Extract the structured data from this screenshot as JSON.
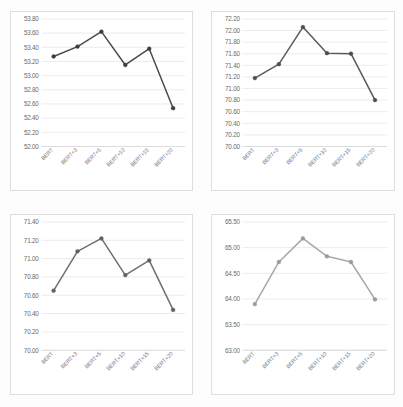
{
  "figure": {
    "background_color": "#fdfdfd",
    "panel_border_color": "#dedede",
    "gridline_color": "#e3e3e3",
    "tick_label_color": "#6b6b6b"
  },
  "chart_data": [
    {
      "id": "chart-top-left",
      "type": "line",
      "title": "",
      "xlabel": "",
      "ylabel": "",
      "categories": [
        "BERT",
        "BERT+3",
        "BERT+5",
        "BERT+10",
        "BERT+15",
        "BERT+20"
      ],
      "values": [
        53.27,
        53.41,
        53.62,
        53.15,
        53.38,
        52.54
      ],
      "ylim": [
        52.0,
        53.8
      ],
      "ytick_step": 0.2,
      "ytick_labels": [
        "52.00",
        "52.20",
        "52.40",
        "52.60",
        "52.80",
        "53.00",
        "53.20",
        "53.40",
        "53.60",
        "53.80"
      ],
      "grid": true,
      "legend": "none",
      "line_color": "#4a4a4a",
      "marker_color": "#3d3d3d",
      "marker": "circle"
    },
    {
      "id": "chart-top-right",
      "type": "line",
      "title": "",
      "xlabel": "",
      "ylabel": "",
      "categories": [
        "BERT",
        "BERT+3",
        "BERT+5",
        "BERT+10",
        "BERT+15",
        "BERT+20"
      ],
      "values": [
        71.18,
        71.42,
        72.06,
        71.61,
        71.6,
        70.8
      ],
      "ylim": [
        70.0,
        72.2
      ],
      "ytick_step": 0.2,
      "ytick_labels": [
        "70.00",
        "70.20",
        "70.40",
        "70.60",
        "70.80",
        "71.00",
        "71.20",
        "71.40",
        "71.60",
        "71.80",
        "72.00",
        "72.20"
      ],
      "grid": true,
      "legend": "none",
      "line_color": "#5a5a5a",
      "marker_color": "#4d4d4d",
      "marker": "circle"
    },
    {
      "id": "chart-bottom-left",
      "type": "line",
      "title": "",
      "xlabel": "",
      "ylabel": "",
      "categories": [
        "BERT",
        "BERT+3",
        "BERT+5",
        "BERT+10",
        "BERT+15",
        "BERT+20"
      ],
      "values": [
        70.65,
        71.08,
        71.22,
        70.82,
        70.98,
        70.44
      ],
      "ylim": [
        70.0,
        71.4
      ],
      "ytick_step": 0.2,
      "ytick_labels": [
        "70.00",
        "70.20",
        "70.40",
        "70.60",
        "70.80",
        "71.00",
        "71.20",
        "71.40"
      ],
      "grid": true,
      "legend": "none",
      "line_color": "#6e6e6e",
      "marker_color": "#606060",
      "marker": "circle"
    },
    {
      "id": "chart-bottom-right",
      "type": "line",
      "title": "",
      "xlabel": "",
      "ylabel": "",
      "categories": [
        "BERT",
        "BERT+3",
        "BERT+5",
        "BERT+10",
        "BERT+15",
        "BERT+20"
      ],
      "values": [
        63.9,
        64.72,
        65.18,
        64.83,
        64.72,
        63.99
      ],
      "ylim": [
        63.0,
        65.5
      ],
      "ytick_step": 0.5,
      "ytick_labels": [
        "63.00",
        "63.50",
        "64.00",
        "64.50",
        "65.00",
        "65.50"
      ],
      "grid": true,
      "legend": "none",
      "line_color": "#a8a8a8",
      "marker_color": "#9a9a9a",
      "marker": "circle"
    }
  ]
}
